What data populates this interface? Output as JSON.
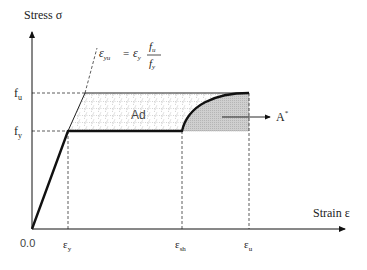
{
  "diagram": {
    "y_axis_label": "Stress σ",
    "x_axis_label": "Strain ε",
    "origin_label": "0.0",
    "y_ticks": {
      "fu": {
        "main": "f",
        "sub": "u"
      },
      "fy": {
        "main": "f",
        "sub": "y"
      }
    },
    "x_ticks": {
      "ey": {
        "main": "ε",
        "sub": "y"
      },
      "esh": {
        "main": "ε",
        "sub": "sh"
      },
      "eu": {
        "main": "ε",
        "sub": "u"
      }
    },
    "formula": {
      "lhs_main": "ε",
      "lhs_sub": "yu",
      "equals": "=",
      "rhs_main": "ε",
      "rhs_sub": "y",
      "num_main": "f",
      "num_sub": "u",
      "den_main": "f",
      "den_sub": "y"
    },
    "area_labels": {
      "hatched": "Ad",
      "shaded_main": "A",
      "shaded_sup": "*"
    },
    "colors": {
      "line": "#111111",
      "dashed": "#333333",
      "shaded_fill": "#c8c8c8",
      "hatch": "#888888"
    }
  }
}
